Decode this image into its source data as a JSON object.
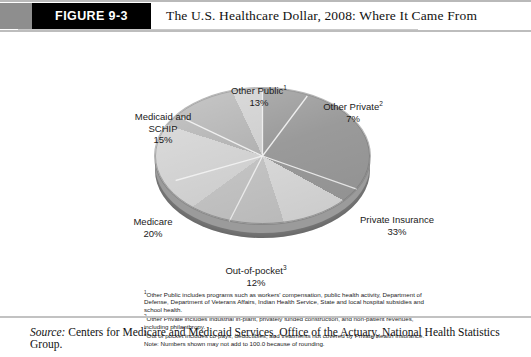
{
  "header": {
    "figure_label": "FIGURE 9-3",
    "title": "The U.S. Healthcare Dollar, 2008: Where It Came From"
  },
  "chart_data": {
    "type": "pie",
    "title": "The U.S. Healthcare Dollar, 2008: Where It Came From",
    "categories": [
      "Private Insurance",
      "Medicare",
      "Medicaid and SCHIP",
      "Other Public",
      "Out-of-pocket",
      "Other Private"
    ],
    "values": [
      33,
      20,
      15,
      13,
      12,
      7
    ],
    "unit": "%",
    "legend": "none",
    "labels": [
      {
        "name": "other-public",
        "text": "Other Public",
        "superscript": "1",
        "value": "13%"
      },
      {
        "name": "other-private",
        "text": "Other Private",
        "superscript": "2",
        "value": "7%"
      },
      {
        "name": "private-insurance",
        "text": "Private Insurance",
        "superscript": "",
        "value": "33%"
      },
      {
        "name": "out-of-pocket",
        "text": "Out-of-pocket",
        "superscript": "3",
        "value": "12%"
      },
      {
        "name": "medicare",
        "text": "Medicare",
        "superscript": "",
        "value": "20%"
      },
      {
        "name": "medicaid-schip",
        "text": "Medicaid and",
        "text2": "SCHIP",
        "superscript": "",
        "value": "15%"
      }
    ],
    "colors": {
      "private_insurance": "#9a9a9a",
      "out_of_pocket": "#d8d8d8",
      "medicare": "#c3c3c3",
      "medicaid_schip": "#d2d2d2",
      "other_public": "#b2b2b2",
      "other_private": "#cfcfcf",
      "pie_side": "#8a8a8a"
    }
  },
  "footnotes": {
    "note1": "1Other Public includes programs such as workers' compensation, public health activity, Department of Defense, Department of Veterans Affairs, Indian Health Service, State and local hospital subsidies and school health.",
    "note2": "2Other Private includes industrial in-plant, privately funded construction, and non-patient revenues, including philanthropy.",
    "note3": "3Out of pocket includes co-pays, deductibles, and treatments not covered by Private Health Insurance.",
    "note4": "Note: Numbers shown may not add to 100.0 because of rounding."
  },
  "source": {
    "label": "Source:",
    "text": " Centers for Medicare and Medicaid Services, Office of the Actuary, National Health Statistics Group."
  }
}
